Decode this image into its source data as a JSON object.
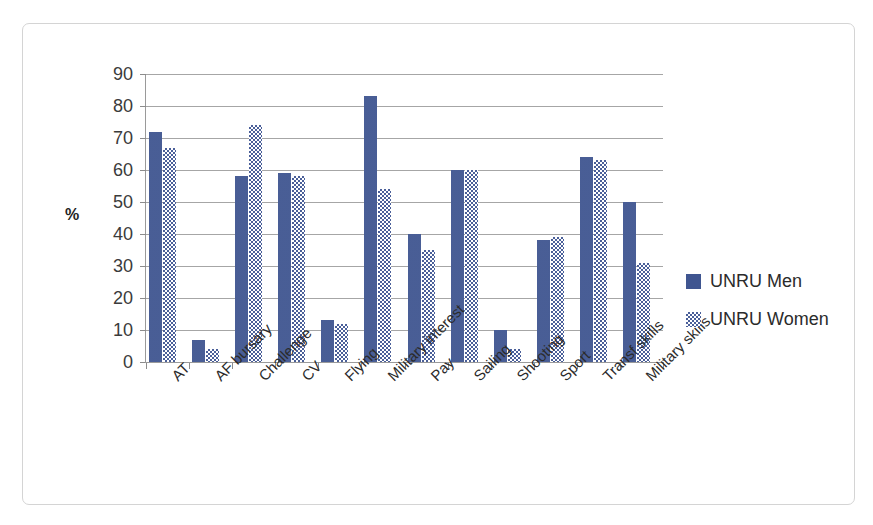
{
  "chart_data": {
    "type": "bar",
    "title": "",
    "xlabel": "",
    "ylabel": "%",
    "ylim": [
      0,
      90
    ],
    "ytick_step": 10,
    "yticks": [
      90,
      80,
      70,
      60,
      50,
      40,
      30,
      20,
      10,
      0
    ],
    "grid": true,
    "legend_position": "right",
    "categories": [
      "AT",
      "AF bursary",
      "Challenge",
      "CV",
      "Flying",
      "Military interest",
      "Pay",
      "Sailing",
      "Shooting",
      "Sport",
      "Transf skills",
      "Military skills"
    ],
    "series": [
      {
        "name": "UNRU Men",
        "color": "#3f5590",
        "pattern": "solid",
        "values": [
          72,
          7,
          58,
          59,
          13,
          83,
          40,
          60,
          10,
          38,
          64,
          50
        ]
      },
      {
        "name": "UNRU Women",
        "color": "#4a5f99",
        "pattern": "checkerboard",
        "values": [
          67,
          4,
          74,
          58,
          12,
          54,
          35,
          60,
          4,
          39,
          63,
          31
        ]
      }
    ]
  },
  "axes": {
    "y_title": "%"
  },
  "legend": {
    "entries": [
      {
        "label": "UNRU Men",
        "swatch": "solid-square-icon"
      },
      {
        "label": "UNRU Women",
        "swatch": "checkered-square-icon"
      }
    ]
  }
}
